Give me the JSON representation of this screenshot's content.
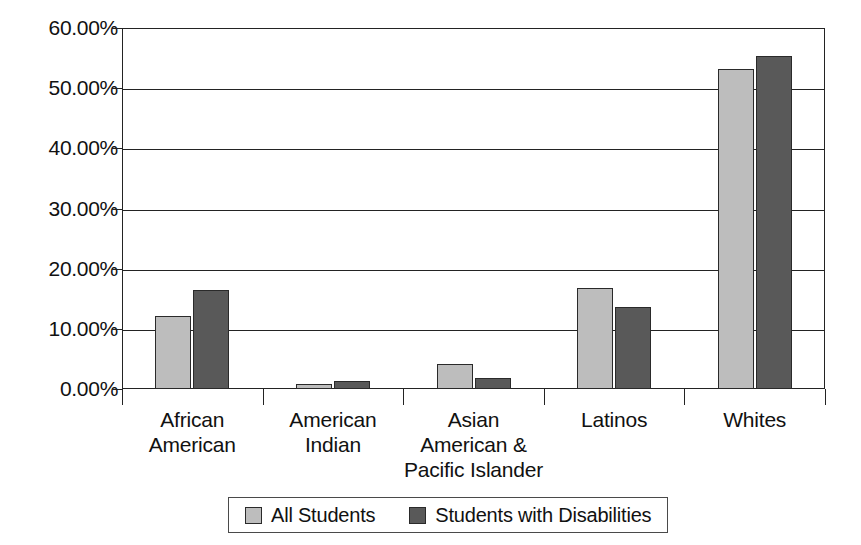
{
  "chart_data": {
    "type": "bar",
    "title": "",
    "subtitle": "",
    "xlabel": "",
    "ylabel": "",
    "categories": [
      "African\nAmerican",
      "American\nIndian",
      "Asian\nAmerican &\nPacific Islander",
      "Latinos",
      "Whites"
    ],
    "series": [
      {
        "name": "All Students",
        "color": "#bdbdbd",
        "values": [
          12.2,
          0.8,
          4.2,
          16.8,
          53.2
        ]
      },
      {
        "name": "Students with Disabilities",
        "color": "#595959",
        "values": [
          16.5,
          1.3,
          1.9,
          13.6,
          55.3
        ]
      }
    ],
    "ylim": [
      0,
      60
    ],
    "ytick_values": [
      0,
      10,
      20,
      30,
      40,
      50,
      60
    ],
    "ytick_labels": [
      "0.00%",
      "10.00%",
      "20.00%",
      "30.00%",
      "40.00%",
      "50.00%",
      "60.00%"
    ],
    "grid": true,
    "legend_position": "bottom"
  },
  "legend": {
    "entries": [
      {
        "label": "All Students",
        "color": "#bdbdbd"
      },
      {
        "label": "Students with Disabilities",
        "color": "#595959"
      }
    ]
  },
  "colors": {
    "series_light": "#bdbdbd",
    "series_dark": "#595959",
    "axis": "#232323",
    "text": "#111111",
    "background": "#ffffff"
  }
}
